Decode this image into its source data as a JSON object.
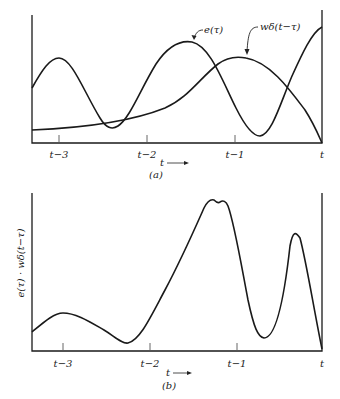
{
  "panel_a": {
    "caption": "(a)",
    "x_arrow_label": "t",
    "ticks": [
      "t−3",
      "t−2",
      "t−1",
      "t"
    ],
    "curve_labels": {
      "e": "e(τ)",
      "w": "wδ(t−τ)"
    }
  },
  "panel_b": {
    "caption": "(b)",
    "x_arrow_label": "t",
    "ticks": [
      "t−3",
      "t−2",
      "t−1",
      "t"
    ],
    "y_label": "e(τ) · wδ(t−τ)"
  }
}
